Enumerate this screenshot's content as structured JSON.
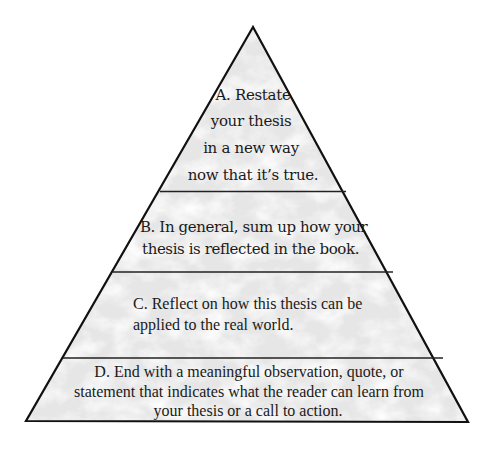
{
  "diagram": {
    "type": "pyramid",
    "colors": {
      "outline": "#111111",
      "fill": "#e9e9e9",
      "vein": "#ffffff",
      "text": "#1a1a1a",
      "background": "#ffffff"
    },
    "tiers": [
      {
        "id": "A",
        "lines": [
          "A. Restate",
          "your thesis",
          "in a new way",
          "now that it’s true."
        ]
      },
      {
        "id": "B",
        "lines": [
          "B. In general, sum up how your",
          "thesis is reflected in the book."
        ]
      },
      {
        "id": "C",
        "lines": [
          "C. Reflect on how this thesis can be",
          "applied to the real world."
        ]
      },
      {
        "id": "D",
        "lines": [
          "D. End with a meaningful observation, quote, or",
          "statement that indicates what the reader can learn from",
          "your thesis or a call to action."
        ]
      }
    ]
  }
}
